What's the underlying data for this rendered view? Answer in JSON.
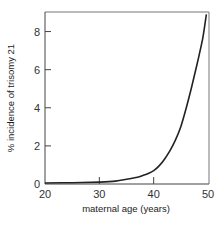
{
  "chart_data": {
    "type": "line",
    "title": "",
    "xlabel": "maternal age (years)",
    "ylabel": "% incidence of trisomy 21",
    "xlim": [
      20,
      50
    ],
    "ylim": [
      0,
      9
    ],
    "xticks": [
      20,
      30,
      40,
      50
    ],
    "yticks": [
      0,
      2,
      4,
      6,
      8
    ],
    "grid": false,
    "legend": null,
    "series": [
      {
        "name": "% incidence of trisomy 21",
        "x": [
          20,
          25,
          30,
          33,
          35,
          37,
          38,
          39,
          40,
          41,
          42,
          43,
          44,
          45,
          46,
          47,
          48,
          49,
          49.7
        ],
        "y": [
          0.05,
          0.07,
          0.1,
          0.15,
          0.25,
          0.35,
          0.45,
          0.55,
          0.7,
          0.95,
          1.3,
          1.75,
          2.3,
          3.0,
          4.0,
          5.1,
          6.3,
          7.6,
          8.9
        ],
        "color": "#222222"
      }
    ]
  },
  "labels": {
    "xlabel": "maternal age (years)",
    "ylabel": "% incidence of trisomy 21",
    "xticks": [
      "20",
      "30",
      "40",
      "50"
    ],
    "yticks": [
      "0",
      "2",
      "4",
      "6",
      "8"
    ]
  }
}
